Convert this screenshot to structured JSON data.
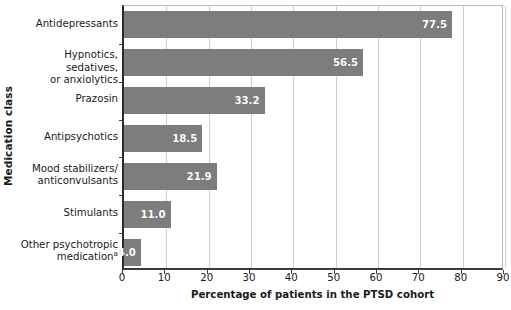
{
  "chart_data": {
    "type": "bar",
    "orientation": "horizontal",
    "title": "",
    "xlabel": "Percentage of patients in the PTSD cohort",
    "ylabel": "Medication class",
    "xlim": [
      0,
      90
    ],
    "xticks": [
      0,
      10,
      20,
      30,
      40,
      50,
      60,
      70,
      80,
      90
    ],
    "grid": "vertical",
    "legend": "none",
    "bar_color": "#7d7d7d",
    "value_label_color": "#ffffff",
    "categories": [
      "Antidepressants",
      "Hypnotics, sedatives, or anxiolytics",
      "Prazosin",
      "Antipsychotics",
      "Mood stabilizers/ anticonvulsants",
      "Stimulants",
      "Other psychotropic medication"
    ],
    "values": [
      77.5,
      56.5,
      33.2,
      18.5,
      21.9,
      11.0,
      4.0
    ],
    "value_labels": [
      "77.5",
      "56.5",
      "33.2",
      "18.5",
      "21.9",
      "11.0",
      "4.0"
    ],
    "bars": [
      {
        "category": "Antidepressants",
        "label_lines": [
          "Antidepressants"
        ],
        "footnote_marker": "",
        "value": 77.5,
        "value_label": "77.5"
      },
      {
        "category": "Hypnotics, sedatives, or anxiolytics",
        "label_lines": [
          "Hypnotics, sedatives,",
          "or anxiolytics"
        ],
        "footnote_marker": "",
        "value": 56.5,
        "value_label": "56.5"
      },
      {
        "category": "Prazosin",
        "label_lines": [
          "Prazosin"
        ],
        "footnote_marker": "",
        "value": 33.2,
        "value_label": "33.2"
      },
      {
        "category": "Antipsychotics",
        "label_lines": [
          "Antipsychotics"
        ],
        "footnote_marker": "",
        "value": 18.5,
        "value_label": "18.5"
      },
      {
        "category": "Mood stabilizers/ anticonvulsants",
        "label_lines": [
          "Mood stabilizers/",
          "anticonvulsants"
        ],
        "footnote_marker": "",
        "value": 21.9,
        "value_label": "21.9"
      },
      {
        "category": "Stimulants",
        "label_lines": [
          "Stimulants"
        ],
        "footnote_marker": "",
        "value": 11.0,
        "value_label": "11.0"
      },
      {
        "category": "Other psychotropic medication",
        "label_lines": [
          "Other psychotropic",
          "medication"
        ],
        "footnote_marker": "a",
        "value": 4.0,
        "value_label": "4.0"
      }
    ]
  }
}
